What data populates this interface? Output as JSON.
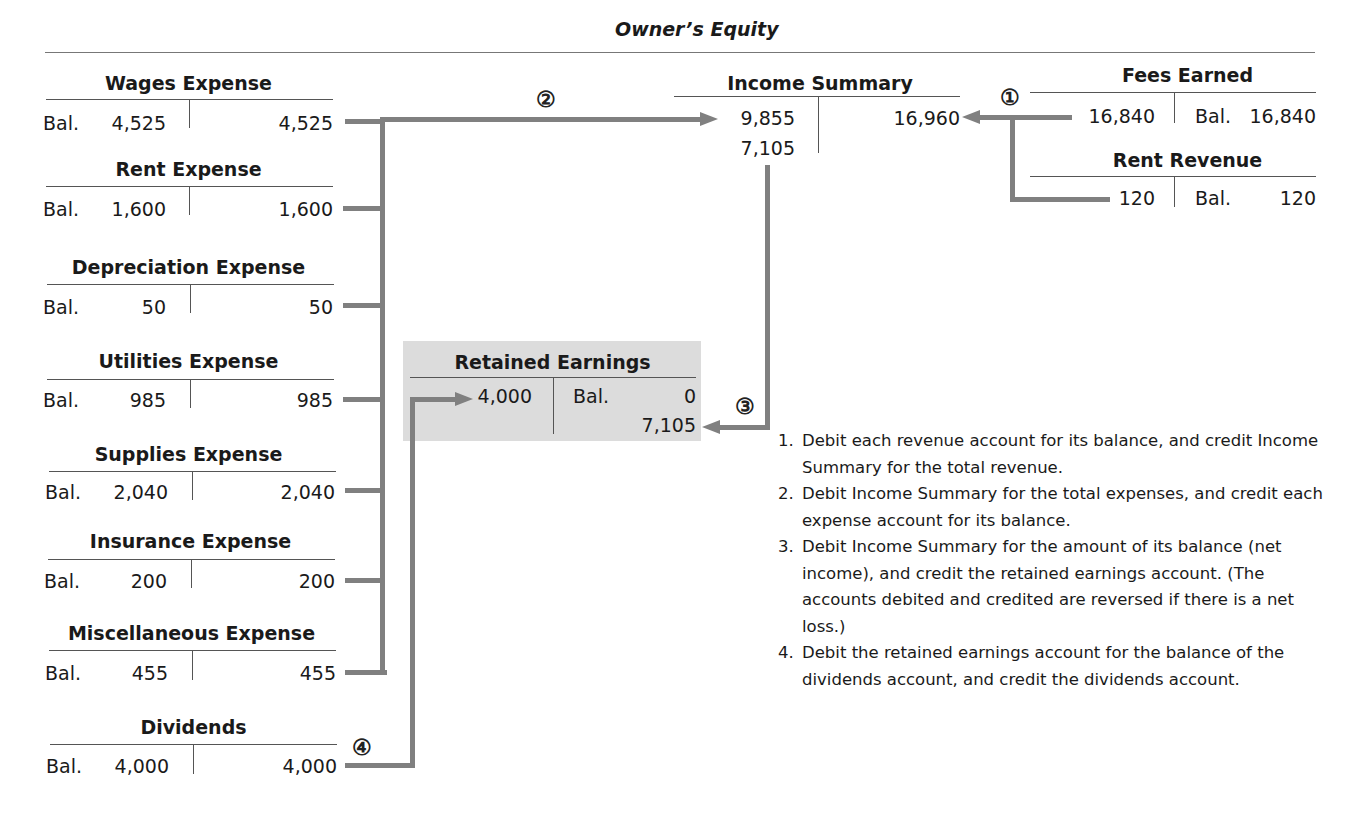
{
  "header": {
    "title": "Owner’s Equity"
  },
  "expense_accounts": [
    {
      "name": "Wages Expense",
      "bal_label": "Bal.",
      "debit": "4,525",
      "credit": "4,525"
    },
    {
      "name": "Rent Expense",
      "bal_label": "Bal.",
      "debit": "1,600",
      "credit": "1,600"
    },
    {
      "name": "Depreciation Expense",
      "bal_label": "Bal.",
      "debit": "50",
      "credit": "50"
    },
    {
      "name": "Utilities Expense",
      "bal_label": "Bal.",
      "debit": "985",
      "credit": "985"
    },
    {
      "name": "Supplies Expense",
      "bal_label": "Bal.",
      "debit": "2,040",
      "credit": "2,040"
    },
    {
      "name": "Insurance Expense",
      "bal_label": "Bal.",
      "debit": "200",
      "credit": "200"
    },
    {
      "name": "Miscellaneous Expense",
      "bal_label": "Bal.",
      "debit": "455",
      "credit": "455"
    }
  ],
  "dividends": {
    "name": "Dividends",
    "bal_label": "Bal.",
    "debit": "4,000",
    "credit": "4,000"
  },
  "income_summary": {
    "name": "Income Summary",
    "debit_1": "9,855",
    "debit_2": "7,105",
    "credit": "16,960"
  },
  "fees_earned": {
    "name": "Fees Earned",
    "debit": "16,840",
    "bal_label": "Bal.",
    "credit": "16,840"
  },
  "rent_revenue": {
    "name": "Rent Revenue",
    "debit": "120",
    "bal_label": "Bal.",
    "credit": "120"
  },
  "retained_earnings": {
    "name": "Retained Earnings",
    "debit": "4,000",
    "bal_label": "Bal.",
    "credit_1": "0",
    "credit_2": "7,105"
  },
  "step_markers": [
    "①",
    "②",
    "③",
    "④"
  ],
  "notes": [
    {
      "num": "1.",
      "text": "Debit each revenue account for its balance, and credit Income Summary for the total revenue."
    },
    {
      "num": "2.",
      "text": "Debit Income Summary for the total expenses, and credit each expense account for its balance."
    },
    {
      "num": "3.",
      "text": "Debit Income Summary for the amount of its balance (net income), and credit the retained earnings account. (The accounts debited and credited are reversed if there is a net loss.)"
    },
    {
      "num": "4.",
      "text": "Debit the retained earnings account for the balance of the dividends account, and credit the dividends account."
    }
  ],
  "colors": {
    "arrow": "#808080",
    "shade": "#dcdcdc",
    "rule": "#555555"
  }
}
